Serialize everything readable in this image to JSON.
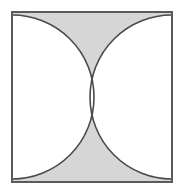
{
  "figure": {
    "title": "Two tangent circles inscribed in a square with shaded region",
    "type": "geometric-diagram",
    "canvas": {
      "width": 189,
      "height": 196
    },
    "square": {
      "name": "bounding-square",
      "x": 12,
      "y": 12,
      "width": 160,
      "height": 170,
      "stroke_color": "#5a5a5a",
      "stroke_width": 2,
      "fill_color": "#ffffff"
    },
    "circles": [
      {
        "name": "left-circle",
        "center_x": 12,
        "center_y": 97,
        "radius": 82,
        "fill_color": "#ffffff",
        "stroke_color": "#4a4a4a",
        "stroke_width": 1.6
      },
      {
        "name": "right-circle",
        "center_x": 172,
        "center_y": 97,
        "radius": 82,
        "fill_color": "#ffffff",
        "stroke_color": "#4a4a4a",
        "stroke_width": 1.6
      }
    ],
    "shaded_region": {
      "name": "shaded-area",
      "description": "Region of the square outside both circles, forming two curvilinear triangles at top and bottom",
      "fill_color": "#d6d6d6"
    },
    "tangent_point": {
      "name": "tangency-point",
      "x": 94,
      "y": 97
    },
    "colors": {
      "shade": "#d6d6d6",
      "white": "#ffffff",
      "outline": "#5a5a5a",
      "arc": "#4a4a4a"
    }
  }
}
